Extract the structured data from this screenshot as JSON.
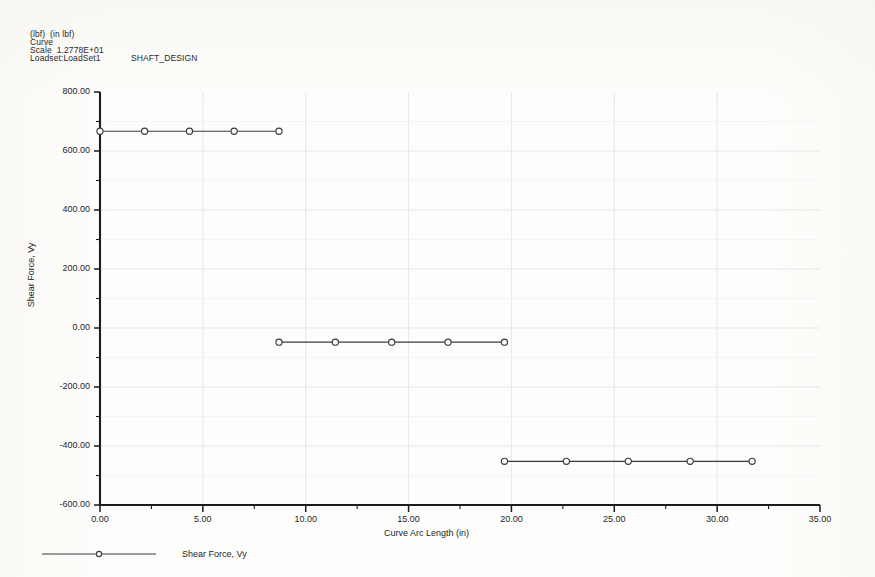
{
  "header": {
    "units": "(lbf)  (in lbf)",
    "curve": "Curve",
    "scale": "Scale  1.2778E+01",
    "loadset": "Loadset:LoadSet1",
    "title": "SHAFT_DESIGN"
  },
  "legend": {
    "entry_label": "Shear Force, Vy"
  },
  "chart_data": {
    "type": "line",
    "title": "",
    "xlabel": "Curve Arc Length (in)",
    "ylabel": "Shear Force, Vy",
    "xlim": [
      0,
      35
    ],
    "ylim": [
      -600,
      800
    ],
    "grid": true,
    "legend_position": "bottom-left",
    "xticks": [
      0,
      5,
      10,
      15,
      20,
      25,
      30,
      35
    ],
    "xtick_labels": [
      "0.00",
      "5.00",
      "10.00",
      "15.00",
      "20.00",
      "25.00",
      "30.00",
      "35.00"
    ],
    "x_minor_step": 2.5,
    "yticks": [
      -600,
      -400,
      -200,
      0,
      200,
      400,
      600,
      800
    ],
    "ytick_labels": [
      "-600.00",
      "-400.00",
      "-200.00",
      "0.00",
      "200.00",
      "400.00",
      "600.00",
      "800.00"
    ],
    "y_minor_step": 100,
    "marker": "circle",
    "series": [
      {
        "name": "Shear Force, Vy",
        "color": "#3b3b3b",
        "segments": [
          {
            "label": "segment-1",
            "x": [
              0.0,
              2.17,
              4.35,
              6.52,
              8.7
            ],
            "y": [
              667.0,
              667.0,
              667.0,
              667.0,
              667.0
            ]
          },
          {
            "label": "segment-2",
            "x": [
              8.7,
              11.44,
              14.18,
              16.92,
              19.66
            ],
            "y": [
              -48.0,
              -48.0,
              -48.0,
              -48.0,
              -48.0
            ]
          },
          {
            "label": "segment-3",
            "x": [
              19.66,
              22.67,
              25.68,
              28.69,
              31.7
            ],
            "y": [
              -452.0,
              -452.0,
              -452.0,
              -452.0,
              -452.0
            ]
          }
        ]
      }
    ]
  }
}
